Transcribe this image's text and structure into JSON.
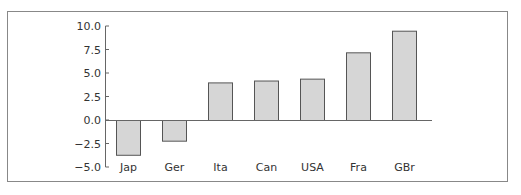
{
  "chart_data": {
    "type": "bar",
    "title": "",
    "xlabel": "",
    "ylabel": "",
    "categories": [
      "Jap",
      "Ger",
      "Ita",
      "Can",
      "USA",
      "Fra",
      "GBr"
    ],
    "values": [
      -3.7,
      -2.2,
      4.0,
      4.2,
      4.4,
      7.2,
      9.5
    ],
    "ylim": [
      -5.0,
      10.0
    ],
    "yticks": [
      10.0,
      7.5,
      5.0,
      2.5,
      0.0,
      -2.5,
      -5.0
    ],
    "ytick_labels": [
      "10.0",
      "7.5",
      "5.0",
      "2.5",
      "0.0",
      "−2.5",
      "−5.0"
    ],
    "grid": false,
    "legend": null,
    "colors": {
      "bar_fill": "#d6d6d6",
      "bar_stroke": "#555555",
      "axis": "#666666",
      "frame": "#888888",
      "text": "#333333"
    }
  }
}
